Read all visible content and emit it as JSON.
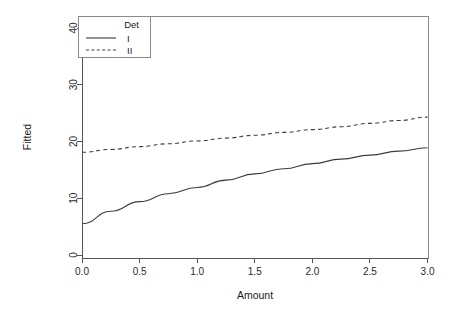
{
  "chart_data": {
    "type": "line",
    "title": "",
    "subtitle": "",
    "xlabel": "Amount",
    "ylabel": "Fitted",
    "xlim": [
      0.0,
      3.0
    ],
    "ylim": [
      0,
      42
    ],
    "xticks": [
      "0.0",
      "0.5",
      "1.0",
      "1.5",
      "2.0",
      "2.5",
      "3.0"
    ],
    "xtick_values": [
      0.0,
      0.5,
      1.0,
      1.5,
      2.0,
      2.5,
      3.0
    ],
    "yticks": [
      "0",
      "10",
      "20",
      "30",
      "40"
    ],
    "ytick_values": [
      0,
      10,
      20,
      30,
      40
    ],
    "grid": false,
    "legend_position": "top-left-inside",
    "legend_title": "Det",
    "x": [
      0.0,
      0.25,
      0.5,
      0.75,
      1.0,
      1.25,
      1.5,
      1.75,
      2.0,
      2.25,
      2.5,
      2.75,
      3.0
    ],
    "series": [
      {
        "name": "I",
        "style": "solid",
        "color": "#3d3d3d",
        "values": [
          5.5,
          7.7,
          9.4,
          10.8,
          11.9,
          13.2,
          14.3,
          15.2,
          16.1,
          16.9,
          17.6,
          18.3,
          18.9
        ]
      },
      {
        "name": "II",
        "style": "dashed",
        "color": "#3d3d3d",
        "values": [
          18.1,
          18.6,
          19.1,
          19.6,
          20.1,
          20.6,
          21.1,
          21.6,
          22.1,
          22.6,
          23.2,
          23.7,
          24.3
        ]
      }
    ]
  },
  "legend": {
    "title": "Det",
    "entries": [
      {
        "label": "I",
        "style": "solid"
      },
      {
        "label": "II",
        "style": "dashed"
      }
    ]
  },
  "axes": {
    "x_title": "Amount",
    "y_title": "Fitted"
  }
}
